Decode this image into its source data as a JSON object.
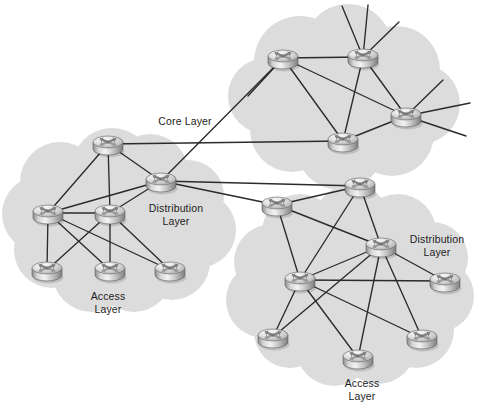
{
  "diagram": {
    "type": "network-topology",
    "canvas": {
      "width": 479,
      "height": 415
    },
    "colors": {
      "cloud_fill": "#dcdcdc",
      "link_stroke": "#2b2b2b",
      "label_text": "#1c1c1c",
      "background": "#ffffff",
      "router_body_light": "#f2f2f2",
      "router_body_mid": "#b8b8b8",
      "router_body_dark": "#8a8a8a",
      "router_outline": "#4a4a4a"
    },
    "labels": [
      {
        "id": "core-layer-label",
        "text": "Core Layer",
        "lines": [
          "Core Layer"
        ],
        "x": 185,
        "y": 125
      },
      {
        "id": "dist-left-label",
        "text": "Distribution Layer",
        "lines": [
          "Distribution",
          "Layer"
        ],
        "x": 176,
        "y": 212
      },
      {
        "id": "access-left-label",
        "text": "Access Layer",
        "lines": [
          "Access",
          "Layer"
        ],
        "x": 108,
        "y": 300
      },
      {
        "id": "dist-right-label",
        "text": "Distribution Layer",
        "lines": [
          "Distribution",
          "Layer"
        ],
        "x": 437,
        "y": 243
      },
      {
        "id": "access-right-label",
        "text": "Access Layer",
        "lines": [
          "Access",
          "Layer"
        ],
        "x": 362,
        "y": 387
      }
    ],
    "clouds": [
      {
        "id": "core-cloud",
        "name": "core-layer-cloud",
        "circles": [
          [
            300,
            62,
            46
          ],
          [
            348,
            48,
            44
          ],
          [
            396,
            70,
            44
          ],
          [
            420,
            104,
            40
          ],
          [
            392,
            134,
            42
          ],
          [
            340,
            146,
            44
          ],
          [
            292,
            130,
            42
          ],
          [
            266,
            96,
            38
          ],
          [
            306,
            100,
            52
          ],
          [
            360,
            96,
            50
          ],
          [
            392,
            104,
            42
          ]
        ]
      },
      {
        "id": "left-cloud",
        "name": "left-distribution-access-cloud",
        "circles": [
          [
            60,
            182,
            40
          ],
          [
            40,
            214,
            38
          ],
          [
            52,
            250,
            38
          ],
          [
            92,
            272,
            40
          ],
          [
            134,
            274,
            38
          ],
          [
            172,
            262,
            38
          ],
          [
            198,
            230,
            38
          ],
          [
            188,
            196,
            36
          ],
          [
            150,
            172,
            38
          ],
          [
            112,
            168,
            40
          ],
          [
            110,
            220,
            52
          ],
          [
            150,
            226,
            46
          ],
          [
            70,
            218,
            44
          ]
        ]
      },
      {
        "id": "right-cloud",
        "name": "right-distribution-access-cloud",
        "circles": [
          [
            300,
            232,
            38
          ],
          [
            272,
            262,
            38
          ],
          [
            264,
            300,
            38
          ],
          [
            290,
            332,
            36
          ],
          [
            334,
            348,
            38
          ],
          [
            378,
            346,
            38
          ],
          [
            416,
            330,
            38
          ],
          [
            438,
            296,
            36
          ],
          [
            432,
            258,
            36
          ],
          [
            398,
            232,
            38
          ],
          [
            352,
            222,
            38
          ],
          [
            350,
            284,
            56
          ],
          [
            300,
            290,
            46
          ],
          [
            400,
            288,
            46
          ]
        ]
      }
    ],
    "routers": [
      {
        "id": "core-r1",
        "name": "router-core-1",
        "x": 283,
        "y": 56,
        "layer": "core"
      },
      {
        "id": "core-r2",
        "name": "router-core-2",
        "x": 363,
        "y": 55,
        "layer": "core"
      },
      {
        "id": "core-r3",
        "name": "router-core-3",
        "x": 406,
        "y": 114,
        "layer": "core"
      },
      {
        "id": "core-r4",
        "name": "router-core-4",
        "x": 343,
        "y": 139,
        "layer": "core"
      },
      {
        "id": "ldist-r1",
        "name": "router-left-distribution-1",
        "x": 108,
        "y": 142,
        "layer": "distribution"
      },
      {
        "id": "ldist-r2",
        "name": "router-left-distribution-2",
        "x": 161,
        "y": 179,
        "layer": "distribution"
      },
      {
        "id": "ldist-r3",
        "name": "router-left-distribution-3",
        "x": 48,
        "y": 211,
        "layer": "distribution"
      },
      {
        "id": "ldist-r4",
        "name": "router-left-distribution-4",
        "x": 110,
        "y": 211,
        "layer": "distribution"
      },
      {
        "id": "lacc-r1",
        "name": "router-left-access-1",
        "x": 47,
        "y": 268,
        "layer": "access"
      },
      {
        "id": "lacc-r2",
        "name": "router-left-access-2",
        "x": 110,
        "y": 268,
        "layer": "access"
      },
      {
        "id": "lacc-r3",
        "name": "router-left-access-3",
        "x": 170,
        "y": 268,
        "layer": "access"
      },
      {
        "id": "rdist-r1",
        "name": "router-right-distribution-1",
        "x": 277,
        "y": 203,
        "layer": "distribution"
      },
      {
        "id": "rdist-r2",
        "name": "router-right-distribution-2",
        "x": 360,
        "y": 184,
        "layer": "distribution"
      },
      {
        "id": "rdist-r3",
        "name": "router-right-distribution-3",
        "x": 381,
        "y": 244,
        "layer": "distribution"
      },
      {
        "id": "rdist-r4",
        "name": "router-right-distribution-4",
        "x": 300,
        "y": 278,
        "layer": "distribution"
      },
      {
        "id": "rdist-r5",
        "name": "router-right-distribution-5",
        "x": 445,
        "y": 279,
        "layer": "distribution"
      },
      {
        "id": "racc-r1",
        "name": "router-right-access-1",
        "x": 273,
        "y": 335,
        "layer": "access"
      },
      {
        "id": "racc-r2",
        "name": "router-right-access-2",
        "x": 358,
        "y": 356,
        "layer": "access"
      },
      {
        "id": "racc-r3",
        "name": "router-right-access-3",
        "x": 422,
        "y": 336,
        "layer": "access"
      }
    ],
    "links": [
      [
        "core-r1",
        "core-r2"
      ],
      [
        "core-r1",
        "core-r4"
      ],
      [
        "core-r1",
        "core-r3"
      ],
      [
        "core-r2",
        "core-r4"
      ],
      [
        "core-r2",
        "core-r3"
      ],
      [
        "core-r3",
        "core-r4"
      ],
      [
        "core-r1",
        "ldist-r2"
      ],
      [
        "core-r4",
        "ldist-r1"
      ],
      [
        "ldist-r1",
        "ldist-r2"
      ],
      [
        "ldist-r1",
        "ldist-r3"
      ],
      [
        "ldist-r1",
        "ldist-r4"
      ],
      [
        "ldist-r2",
        "ldist-r3"
      ],
      [
        "ldist-r2",
        "ldist-r4"
      ],
      [
        "ldist-r3",
        "ldist-r4"
      ],
      [
        "ldist-r3",
        "lacc-r1"
      ],
      [
        "ldist-r3",
        "lacc-r2"
      ],
      [
        "ldist-r3",
        "lacc-r3"
      ],
      [
        "ldist-r4",
        "lacc-r1"
      ],
      [
        "ldist-r4",
        "lacc-r2"
      ],
      [
        "ldist-r4",
        "lacc-r3"
      ],
      [
        "ldist-r2",
        "rdist-r1"
      ],
      [
        "ldist-r2",
        "rdist-r2"
      ],
      [
        "rdist-r1",
        "rdist-r2"
      ],
      [
        "rdist-r1",
        "rdist-r4"
      ],
      [
        "rdist-r1",
        "rdist-r3"
      ],
      [
        "rdist-r2",
        "rdist-r3"
      ],
      [
        "rdist-r2",
        "rdist-r4"
      ],
      [
        "rdist-r3",
        "rdist-r4"
      ],
      [
        "rdist-r3",
        "rdist-r5"
      ],
      [
        "rdist-r4",
        "rdist-r5"
      ],
      [
        "rdist-r3",
        "racc-r1"
      ],
      [
        "rdist-r3",
        "racc-r2"
      ],
      [
        "rdist-r3",
        "racc-r3"
      ],
      [
        "rdist-r4",
        "racc-r1"
      ],
      [
        "rdist-r4",
        "racc-r2"
      ],
      [
        "rdist-r4",
        "racc-r3"
      ]
    ],
    "stubs": [
      {
        "from": "core-r2",
        "x": 342,
        "y": 6
      },
      {
        "from": "core-r2",
        "x": 368,
        "y": 5
      },
      {
        "from": "core-r2",
        "x": 399,
        "y": 22
      },
      {
        "from": "core-r3",
        "x": 443,
        "y": 80
      },
      {
        "from": "core-r3",
        "x": 470,
        "y": 103
      },
      {
        "from": "core-r3",
        "x": 466,
        "y": 136
      },
      {
        "from": "core-r1",
        "x": 248,
        "y": 96
      }
    ]
  }
}
